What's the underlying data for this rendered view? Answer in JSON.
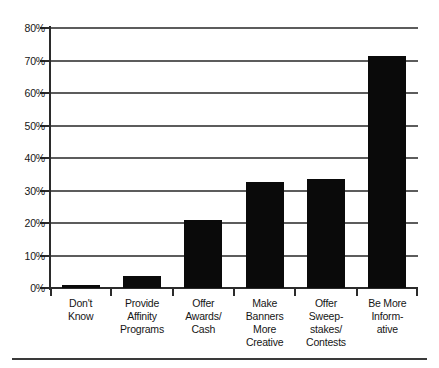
{
  "chart_data": {
    "type": "bar",
    "title": "",
    "xlabel": "",
    "ylabel": "",
    "ylim": [
      0,
      80
    ],
    "ytick_step": 10,
    "grid": true,
    "legend": false,
    "value_suffix": "%",
    "bar_color": "#0a0a0a",
    "grid_color": "#5c5c5c",
    "axis_color": "#2b2b2b",
    "categories": [
      "Don't Know",
      "Provide Affinity Programs",
      "Offer Awards/ Cash",
      "Make Banners More Creative",
      "Offer Sweep-stakes/ Contests",
      "Be More Inform-ative"
    ],
    "category_lines": [
      [
        "Don't",
        "Know"
      ],
      [
        "Provide",
        "Affinity",
        "Programs"
      ],
      [
        "Offer",
        "Awards/",
        "Cash"
      ],
      [
        "Make",
        "Banners",
        "More",
        "Creative"
      ],
      [
        "Offer",
        "Sweep-",
        "stakes/",
        "Contests"
      ],
      [
        "Be More",
        "Inform-",
        "ative"
      ]
    ],
    "values": [
      1.0,
      3.8,
      20.8,
      32.6,
      33.5,
      71.5
    ],
    "ytick_labels": [
      "0%",
      "10%",
      "20%",
      "30%",
      "40%",
      "50%",
      "60%",
      "70%",
      "80%"
    ],
    "ytick_values": [
      0,
      10,
      20,
      30,
      40,
      50,
      60,
      70,
      80
    ]
  }
}
